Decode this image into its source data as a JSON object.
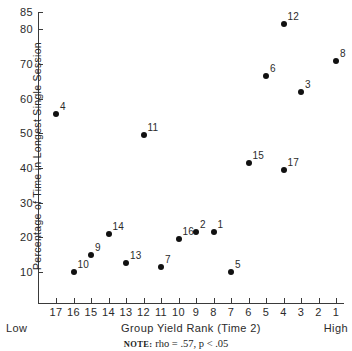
{
  "chart_data": {
    "type": "scatter",
    "title": "",
    "xlabel": "Group Yield Rank (Time 2)",
    "ylabel": "Percentage of Time in Longest Single Session",
    "x_low_label": "Low",
    "x_high_label": "High",
    "xticks": [
      "17",
      "16",
      "15",
      "14",
      "13",
      "12",
      "11",
      "10",
      "9",
      "8",
      "7",
      "6",
      "5",
      "4",
      "3",
      "2",
      "1"
    ],
    "xtick_values": [
      17,
      16,
      15,
      14,
      13,
      12,
      11,
      10,
      9,
      8,
      7,
      6,
      5,
      4,
      3,
      2,
      1
    ],
    "yticks": [
      "85",
      "80",
      "70",
      "60",
      "50",
      "40",
      "30",
      "20",
      "10"
    ],
    "ytick_values": [
      85,
      80,
      70,
      60,
      50,
      40,
      30,
      20,
      10
    ],
    "xlim": [
      17.5,
      0.5
    ],
    "ylim": [
      5,
      85
    ],
    "x_axis_inverted": true,
    "grid": false,
    "legend": "none",
    "points": [
      {
        "label": "4",
        "x": 17,
        "y": 55.5
      },
      {
        "label": "10",
        "x": 16,
        "y": 10.0
      },
      {
        "label": "9",
        "x": 15,
        "y": 15.0
      },
      {
        "label": "14",
        "x": 14,
        "y": 21.0
      },
      {
        "label": "13",
        "x": 13,
        "y": 12.5
      },
      {
        "label": "11",
        "x": 12,
        "y": 49.5
      },
      {
        "label": "7",
        "x": 11,
        "y": 11.5
      },
      {
        "label": "16",
        "x": 10,
        "y": 19.5
      },
      {
        "label": "2",
        "x": 9,
        "y": 21.5
      },
      {
        "label": "1",
        "x": 8,
        "y": 21.5
      },
      {
        "label": "5",
        "x": 7,
        "y": 10.0
      },
      {
        "label": "15",
        "x": 6,
        "y": 41.5
      },
      {
        "label": "6",
        "x": 5,
        "y": 66.5
      },
      {
        "label": "17",
        "x": 4,
        "y": 39.5
      },
      {
        "label": "12",
        "x": 4,
        "y": 81.5
      },
      {
        "label": "3",
        "x": 3,
        "y": 62.0
      },
      {
        "label": "8",
        "x": 1,
        "y": 71.0
      }
    ],
    "note_keyword": "NOTE:",
    "note_text": "rho = .57, p < .05",
    "statistics": {
      "rho": 0.57,
      "p_threshold": 0.05,
      "p_relation": "<"
    },
    "point_color": "#111111",
    "axis_color": "#3a3a3a"
  }
}
